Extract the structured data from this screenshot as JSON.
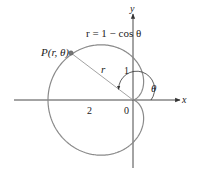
{
  "figure": {
    "equation": "r = 1 − cos θ",
    "point_label": "P(r, θ)",
    "radius_label": "r",
    "angle_label": "θ",
    "axis_x_label": "x",
    "axis_y_label": "y",
    "tick_labels": {
      "two": "2",
      "zero": "0",
      "one": "1"
    },
    "colors": {
      "curve": "#8a8a8a",
      "axes": "#333333",
      "point": "#777777",
      "text": "#222222"
    }
  }
}
